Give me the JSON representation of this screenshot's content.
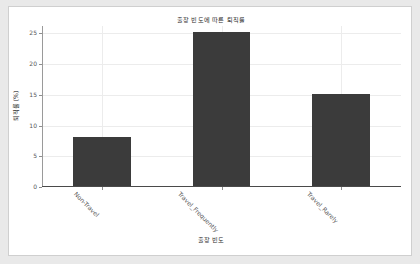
{
  "chart_data": {
    "type": "bar",
    "title": "출장 빈도에 따른 퇴직률",
    "xlabel": "출장 빈도",
    "ylabel": "퇴직률 (%)",
    "categories": [
      "Non-Travel",
      "Travel_Frequently",
      "Travel_Rarely"
    ],
    "values": [
      8,
      25,
      15
    ],
    "ylim": [
      0,
      26.2
    ],
    "yticks": [
      0,
      5,
      10,
      15,
      20,
      25
    ],
    "ytick_labels": [
      "0",
      "5",
      "10",
      "15",
      "20",
      "25"
    ],
    "grid": true,
    "grid_axis": "both",
    "legend": false,
    "bar_color": "#3b3b3b",
    "figure_background": "#ffffff",
    "page_background": "#e9e9e9",
    "grid_color": "#ececec",
    "axis_color": "#9a9a9a",
    "tick_label_rotation": 45
  }
}
